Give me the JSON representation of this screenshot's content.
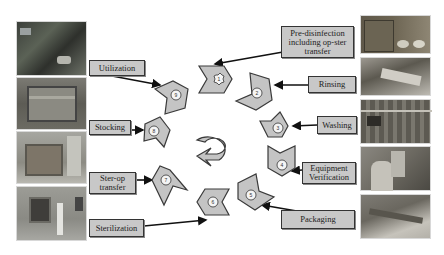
{
  "diagram": {
    "title": "",
    "type": "instrument reprocessing cycle",
    "steps": [
      {
        "number": "1",
        "label": "Pre-disinfection including op-ster transfer"
      },
      {
        "number": "2",
        "label": "Rinsing"
      },
      {
        "number": "3",
        "label": "Washing"
      },
      {
        "number": "4",
        "label": "Equipment Verification"
      },
      {
        "number": "5",
        "label": "Packaging"
      },
      {
        "number": "6",
        "label": "Sterilization"
      },
      {
        "number": "7",
        "label": "Ster-op transfer"
      },
      {
        "number": "8",
        "label": "Stocking"
      },
      {
        "number": "9",
        "label": "Utilization"
      }
    ],
    "labels": {
      "predisinfection_line1": "Pre-disinfection",
      "predisinfection_line2": "including op-ster",
      "predisinfection_line3": "transfer",
      "rinsing": "Rinsing",
      "washing": "Washing",
      "equipment_line1": "Equipment",
      "equipment_line2": "Verification",
      "packaging": "Packaging",
      "sterilization": "Sterilization",
      "sterop_line1": "Ster-op",
      "sterop_line2": "transfer",
      "stocking": "Stocking",
      "utilization": "Utilization"
    },
    "center_icon": "cycle-arrow-icon",
    "left_photos": [
      "operating-room-photo",
      "storage-cabinet-photo",
      "transport-cart-photo",
      "sterilizer-photo"
    ],
    "right_photos": [
      "soaking-tray-photo",
      "rinsing-photo",
      "washer-rack-photo",
      "inspection-photo",
      "packaging-photo"
    ],
    "colors": {
      "shape_fill": "#c4c4c4",
      "shape_stroke": "#3a3a3a",
      "label_fill": "#c8c8c8",
      "arrow": "#111111"
    }
  }
}
